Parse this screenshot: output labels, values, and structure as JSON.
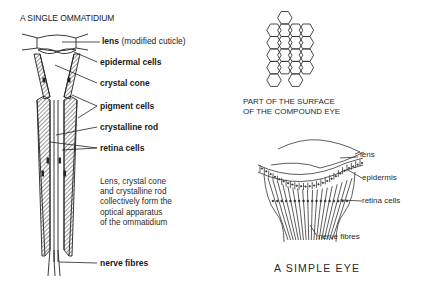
{
  "ommatidium": {
    "title": "A SINGLE OMMATIDIUM",
    "labels": {
      "lens": "lens",
      "lens_note": "(modified cuticle)",
      "epidermal": "epidermal cells",
      "crystal_cone": "crystal cone",
      "pigment": "pigment cells",
      "crystalline_rod": "crystalline rod",
      "retina": "retina cells",
      "nerve": "nerve fibres"
    },
    "note_lines": [
      "Lens, crystal cone",
      "and crystalline rod",
      "collectively form the",
      "optical apparatus",
      "of the ommatidium"
    ]
  },
  "compound_eye": {
    "caption_lines": [
      "PART OF THE SURFACE",
      "OF THE COMPOUND EYE"
    ],
    "hexagon_grid": {
      "columns": 4,
      "rows_per_column": [
        5,
        5,
        5,
        4
      ]
    }
  },
  "simple_eye": {
    "title": "A SIMPLE EYE",
    "labels": {
      "lens": "lens",
      "epidermis": "epidermis",
      "retina": "retina cells",
      "nerve": "nerve fibres"
    }
  },
  "colors": {
    "ink": "#222222",
    "background": "#ffffff"
  }
}
